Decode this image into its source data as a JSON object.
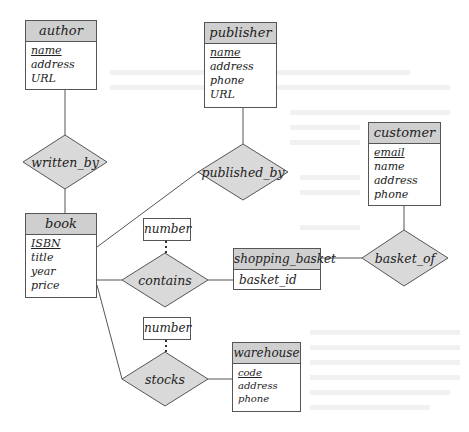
{
  "diagram": {
    "type": "E-R diagram",
    "entities": [
      {
        "id": "author",
        "name": "author",
        "attributes": [
          {
            "name": "name",
            "key": true
          },
          {
            "name": "address",
            "key": false
          },
          {
            "name": "URL",
            "key": false
          }
        ]
      },
      {
        "id": "publisher",
        "name": "publisher",
        "attributes": [
          {
            "name": "name",
            "key": true
          },
          {
            "name": "address",
            "key": false
          },
          {
            "name": "phone",
            "key": false
          },
          {
            "name": "URL",
            "key": false
          }
        ]
      },
      {
        "id": "customer",
        "name": "customer",
        "attributes": [
          {
            "name": "email",
            "key": true
          },
          {
            "name": "name",
            "key": false
          },
          {
            "name": "address",
            "key": false
          },
          {
            "name": "phone",
            "key": false
          }
        ]
      },
      {
        "id": "book",
        "name": "book",
        "attributes": [
          {
            "name": "ISBN",
            "key": true
          },
          {
            "name": "title",
            "key": false
          },
          {
            "name": "year",
            "key": false
          },
          {
            "name": "price",
            "key": false
          }
        ]
      },
      {
        "id": "shopping_basket",
        "name": "shopping_basket",
        "attributes": [
          {
            "name": "basket_id",
            "key": false
          }
        ]
      },
      {
        "id": "warehouse",
        "name": "warehouse",
        "attributes": [
          {
            "name": "code",
            "key": true
          },
          {
            "name": "address",
            "key": false
          },
          {
            "name": "phone",
            "key": false
          }
        ]
      }
    ],
    "relationships": [
      {
        "id": "written_by",
        "name": "written_by",
        "connects": [
          "author",
          "book"
        ]
      },
      {
        "id": "published_by",
        "name": "published_by",
        "connects": [
          "publisher",
          "book"
        ]
      },
      {
        "id": "contains",
        "name": "contains",
        "connects": [
          "book",
          "shopping_basket"
        ],
        "attribute": "number"
      },
      {
        "id": "basket_of",
        "name": "basket_of",
        "connects": [
          "shopping_basket",
          "customer"
        ]
      },
      {
        "id": "stocks",
        "name": "stocks",
        "connects": [
          "book",
          "warehouse"
        ],
        "attribute": "number"
      }
    ],
    "relationship_attributes": {
      "contains": "number",
      "stocks": "number"
    },
    "colors": {
      "entity_header": "#cfcfcf",
      "relationship_fill": "#d9d9d9",
      "line": "#555555",
      "background": "#ffffff"
    }
  }
}
